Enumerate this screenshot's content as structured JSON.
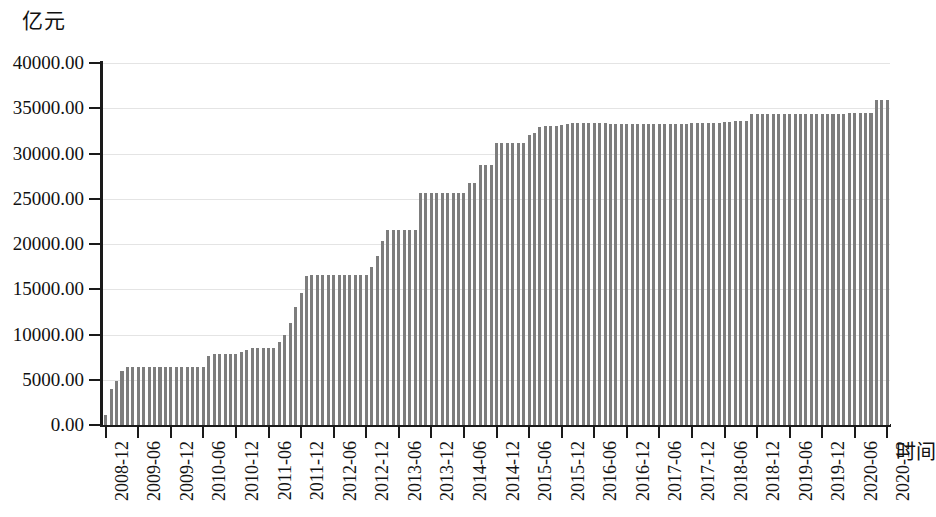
{
  "chart_data": {
    "type": "bar",
    "title": "",
    "subtitle": "",
    "ylabel": "亿元",
    "xlabel": "时间",
    "ylim": [
      0,
      40000
    ],
    "ytick_labels": [
      "0.00",
      "5000.00",
      "10000.00",
      "15000.00",
      "20000.00",
      "25000.00",
      "30000.00",
      "35000.00",
      "40000.00"
    ],
    "ytick_values": [
      0,
      5000,
      10000,
      15000,
      20000,
      25000,
      30000,
      35000,
      40000
    ],
    "grid": true,
    "grid_axis": "y",
    "legend": "none",
    "bar_color": "#7d7d7d",
    "axis_color": "#1a1a1a",
    "gridline_color": "#e4e4e4",
    "xtick_labels": [
      "2008-12",
      "2009-06",
      "2009-12",
      "2010-06",
      "2010-12",
      "2011-06",
      "2011-12",
      "2012-06",
      "2012-12",
      "2013-06",
      "2013-12",
      "2014-06",
      "2014-12",
      "2015-06",
      "2015-12",
      "2016-06",
      "2016-12",
      "2017-06",
      "2017-12",
      "2018-06",
      "2018-12",
      "2019-06",
      "2019-12",
      "2020-06",
      "2020-12"
    ],
    "xtick_interval_months": 6,
    "categories": [
      "2008-12",
      "2009-01",
      "2009-02",
      "2009-03",
      "2009-04",
      "2009-05",
      "2009-06",
      "2009-07",
      "2009-08",
      "2009-09",
      "2009-10",
      "2009-11",
      "2009-12",
      "2010-01",
      "2010-02",
      "2010-03",
      "2010-04",
      "2010-05",
      "2010-06",
      "2010-07",
      "2010-08",
      "2010-09",
      "2010-10",
      "2010-11",
      "2010-12",
      "2011-01",
      "2011-02",
      "2011-03",
      "2011-04",
      "2011-05",
      "2011-06",
      "2011-07",
      "2011-08",
      "2011-09",
      "2011-10",
      "2011-11",
      "2011-12",
      "2012-01",
      "2012-02",
      "2012-03",
      "2012-04",
      "2012-05",
      "2012-06",
      "2012-07",
      "2012-08",
      "2012-09",
      "2012-10",
      "2012-11",
      "2012-12",
      "2013-01",
      "2013-02",
      "2013-03",
      "2013-04",
      "2013-05",
      "2013-06",
      "2013-07",
      "2013-08",
      "2013-09",
      "2013-10",
      "2013-11",
      "2013-12",
      "2014-01",
      "2014-02",
      "2014-03",
      "2014-04",
      "2014-05",
      "2014-06",
      "2014-07",
      "2014-08",
      "2014-09",
      "2014-10",
      "2014-11",
      "2014-12",
      "2015-01",
      "2015-02",
      "2015-03",
      "2015-04",
      "2015-05",
      "2015-06",
      "2015-07",
      "2015-08",
      "2015-09",
      "2015-10",
      "2015-11",
      "2015-12",
      "2016-01",
      "2016-02",
      "2016-03",
      "2016-04",
      "2016-05",
      "2016-06",
      "2016-07",
      "2016-08",
      "2016-09",
      "2016-10",
      "2016-11",
      "2016-12",
      "2017-01",
      "2017-02",
      "2017-03",
      "2017-04",
      "2017-05",
      "2017-06",
      "2017-07",
      "2017-08",
      "2017-09",
      "2017-10",
      "2017-11",
      "2017-12",
      "2018-01",
      "2018-02",
      "2018-03",
      "2018-04",
      "2018-05",
      "2018-06",
      "2018-07",
      "2018-08",
      "2018-09",
      "2018-10",
      "2018-11",
      "2018-12",
      "2019-01",
      "2019-02",
      "2019-03",
      "2019-04",
      "2019-05",
      "2019-06",
      "2019-07",
      "2019-08",
      "2019-09",
      "2019-10",
      "2019-11",
      "2019-12",
      "2020-01",
      "2020-02",
      "2020-03",
      "2020-04",
      "2020-05",
      "2020-06",
      "2020-07",
      "2020-08",
      "2020-09",
      "2020-10",
      "2020-11",
      "2020-12"
    ],
    "values": [
      1100,
      4000,
      4900,
      6000,
      6450,
      6450,
      6450,
      6450,
      6450,
      6450,
      6450,
      6450,
      6450,
      6450,
      6450,
      6450,
      6450,
      6450,
      6450,
      7600,
      7900,
      7900,
      7900,
      7900,
      7900,
      8100,
      8300,
      8500,
      8500,
      8500,
      8500,
      8500,
      9200,
      9900,
      11300,
      13000,
      14600,
      16500,
      16600,
      16600,
      16600,
      16600,
      16600,
      16600,
      16600,
      16600,
      16600,
      16600,
      16600,
      17500,
      18700,
      20300,
      21500,
      21500,
      21500,
      21500,
      21500,
      21500,
      25600,
      25600,
      25600,
      25600,
      25600,
      25600,
      25600,
      25600,
      25600,
      26700,
      26700,
      28700,
      28700,
      28700,
      31200,
      31200,
      31200,
      31200,
      31200,
      31200,
      32000,
      32300,
      32900,
      33000,
      33000,
      33000,
      33100,
      33300,
      33400,
      33400,
      33400,
      33400,
      33400,
      33400,
      33400,
      33300,
      33300,
      33300,
      33300,
      33300,
      33300,
      33300,
      33300,
      33300,
      33300,
      33300,
      33300,
      33300,
      33300,
      33300,
      33400,
      33400,
      33400,
      33400,
      33400,
      33400,
      33500,
      33500,
      33600,
      33600,
      33600,
      34400,
      34400,
      34400,
      34400,
      34400,
      34400,
      34400,
      34400,
      34400,
      34400,
      34400,
      34400,
      34400,
      34400,
      34400,
      34400,
      34400,
      34400,
      34500,
      34500,
      34500,
      34500,
      34500,
      35900,
      35900,
      35900
    ]
  }
}
